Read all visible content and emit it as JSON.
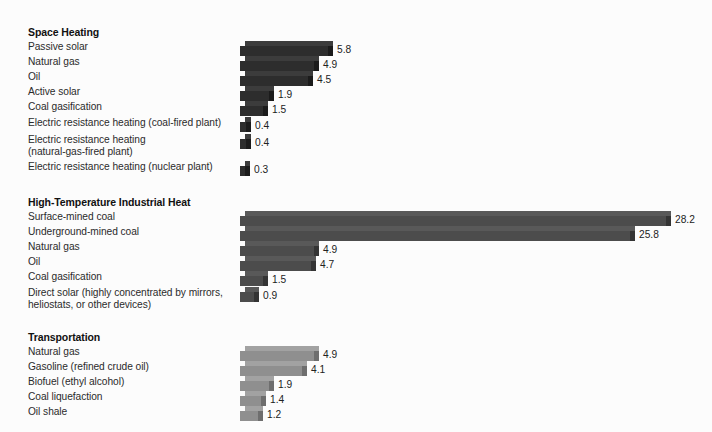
{
  "figure": {
    "background_color": "#fcfcfc",
    "bar_origin_x_px": 240,
    "px_per_unit": 15.1
  },
  "chart_data": {
    "type": "bar",
    "orientation": "horizontal",
    "title": "",
    "xlabel": "",
    "ylabel": "",
    "grid": false,
    "legend": "none",
    "xlim": [
      0,
      28.2
    ],
    "value_labels_shown": true,
    "groups": [
      {
        "name": "Space Heating",
        "bar_color": "#2d2d2d",
        "categories": [
          "Passive solar",
          "Natural gas",
          "Oil",
          "Active solar",
          "Coal gasification",
          "Electric resistance heating (coal-fired plant)",
          "Electric resistance heating\n(natural-gas-fired plant)",
          "Electric resistance heating (nuclear plant)"
        ],
        "values": [
          5.8,
          4.9,
          4.5,
          1.9,
          1.5,
          0.4,
          0.4,
          0.3
        ]
      },
      {
        "name": "High-Temperature Industrial Heat",
        "bar_color": "#4c4c4c",
        "categories": [
          "Surface-mined coal",
          "Underground-mined coal",
          "Natural gas",
          "Oil",
          "Coal gasification",
          "Direct solar (highly concentrated by mirrors,\nheliostats, or other devices)"
        ],
        "values": [
          28.2,
          25.8,
          4.9,
          4.7,
          1.5,
          0.9
        ]
      },
      {
        "name": "Transportation",
        "bar_color": "#8f8f8f",
        "categories": [
          "Natural gas",
          "Gasoline (refined crude oil)",
          "Biofuel (ethyl alcohol)",
          "Coal liquefaction",
          "Oil shale"
        ],
        "values": [
          4.9,
          4.1,
          1.9,
          1.4,
          1.2
        ]
      }
    ]
  },
  "sections": [
    {
      "title": "Space Heating",
      "title_top": 26,
      "shade": "shade-dark",
      "rows": [
        {
          "label": "Passive solar",
          "value": 5.8,
          "value_text": "5.8",
          "top": 41
        },
        {
          "label": "Natural gas",
          "value": 4.9,
          "value_text": "4.9",
          "top": 56
        },
        {
          "label": "Oil",
          "value": 4.5,
          "value_text": "4.5",
          "top": 71
        },
        {
          "label": "Active solar",
          "value": 1.9,
          "value_text": "1.9",
          "top": 86
        },
        {
          "label": "Coal gasification",
          "value": 1.5,
          "value_text": "1.5",
          "top": 101
        },
        {
          "label": "Electric resistance heating (coal-fired plant)",
          "value": 0.4,
          "value_text": "0.4",
          "top": 117
        },
        {
          "label": "Electric resistance heating\n(natural-gas-fired plant)",
          "value": 0.4,
          "value_text": "0.4",
          "top": 134
        },
        {
          "label": "Electric resistance heating (nuclear plant)",
          "value": 0.3,
          "value_text": "0.3",
          "top": 161
        }
      ]
    },
    {
      "title": "High-Temperature Industrial Heat",
      "title_top": 196,
      "shade": "shade-mid",
      "rows": [
        {
          "label": "Surface-mined coal",
          "value": 28.2,
          "value_text": "28.2",
          "top": 211
        },
        {
          "label": "Underground-mined coal",
          "value": 25.8,
          "value_text": "25.8",
          "top": 226
        },
        {
          "label": "Natural gas",
          "value": 4.9,
          "value_text": "4.9",
          "top": 241
        },
        {
          "label": "Oil",
          "value": 4.7,
          "value_text": "4.7",
          "top": 256
        },
        {
          "label": "Coal gasification",
          "value": 1.5,
          "value_text": "1.5",
          "top": 271
        },
        {
          "label": "Direct solar (highly concentrated by mirrors,\nheliostats, or other devices)",
          "value": 0.9,
          "value_text": "0.9",
          "top": 287
        }
      ]
    },
    {
      "title": "Transportation",
      "title_top": 331,
      "shade": "shade-light",
      "rows": [
        {
          "label": "Natural gas",
          "value": 4.9,
          "value_text": "4.9",
          "top": 346
        },
        {
          "label": "Gasoline (refined crude oil)",
          "value": 4.1,
          "value_text": "4.1",
          "top": 361
        },
        {
          "label": "Biofuel (ethyl alcohol)",
          "value": 1.9,
          "value_text": "1.9",
          "top": 376
        },
        {
          "label": "Coal liquefaction",
          "value": 1.4,
          "value_text": "1.4",
          "top": 391
        },
        {
          "label": "Oil shale",
          "value": 1.2,
          "value_text": "1.2",
          "top": 406
        }
      ]
    }
  ]
}
